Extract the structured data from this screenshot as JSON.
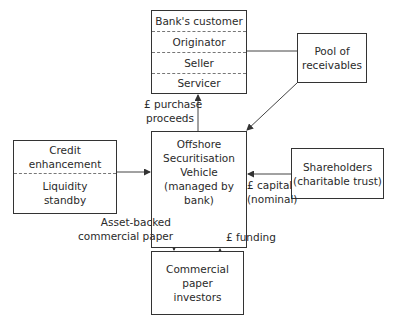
{
  "boxes": {
    "bank_customer": {
      "rows": [
        "Bank's customer",
        "Originator",
        "Seller",
        "Servicer"
      ]
    },
    "pool": {
      "line1": "Pool of",
      "line2": "receivables"
    },
    "credit": {
      "top1": "Credit",
      "top2": "enhancement",
      "bottom1": "Liquidity",
      "bottom2": "standby"
    },
    "vehicle": {
      "line1": "Offshore",
      "line2": "Securitisation",
      "line3": "Vehicle",
      "line4": "(managed by bank)"
    },
    "shareholders": {
      "line1": "Shareholders",
      "line2": "(charitable trust)"
    },
    "investors": {
      "line1": "Commercial",
      "line2": "paper",
      "line3": "investors"
    }
  },
  "arrows": {
    "purchase": {
      "line1": "£ purchase",
      "line2": "proceeds"
    },
    "capital": {
      "line1": "£ capital",
      "line2": "(nominal)"
    },
    "abcp": {
      "line1": "Asset-backed",
      "line2": "commercial paper"
    },
    "funding": {
      "line1": "£ funding"
    }
  }
}
